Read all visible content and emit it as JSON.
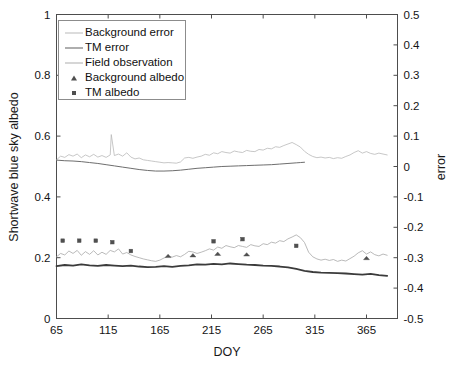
{
  "chart_data": {
    "type": "line",
    "title": "",
    "xlabel": "DOY",
    "ylabel": "Shortwave blue sky albedo",
    "ylabel_right": "error",
    "xlim": [
      65,
      395
    ],
    "ylim": [
      0,
      1
    ],
    "ylim_right": [
      -0.5,
      0.5
    ],
    "xticks": [
      65,
      115,
      165,
      215,
      265,
      315,
      365
    ],
    "xticklabels": [
      "65",
      "115",
      "165",
      "215",
      "265",
      "315",
      "365"
    ],
    "yticks": [
      0,
      0.2,
      0.4,
      0.6,
      0.8,
      1
    ],
    "yticklabels": [
      "0",
      "0.2",
      "0.4",
      "0.6",
      "0.8",
      "1"
    ],
    "yticks_right": [
      -0.5,
      -0.4,
      -0.3,
      -0.2,
      -0.1,
      0,
      0.1,
      0.2,
      0.3,
      0.4,
      0.5
    ],
    "yticklabels_right": [
      "-0.5",
      "-0.4",
      "-0.3",
      "-0.2",
      "-0.1",
      "0",
      "0.1",
      "0.2",
      "0.3",
      "0.4",
      "0.5"
    ],
    "grid": false,
    "legend_position": "upper-left",
    "series": [
      {
        "name": "Background error",
        "axis": "right",
        "color": "#b9b9b9",
        "width": 0.8,
        "style": "line",
        "x": [
          65,
          69,
          73,
          77,
          81,
          85,
          89,
          93,
          97,
          101,
          105,
          109,
          113,
          117,
          118,
          121,
          125,
          129,
          133,
          137,
          141,
          145,
          149,
          153,
          157,
          161,
          165,
          169,
          173,
          177,
          181,
          185,
          189,
          193,
          197,
          201,
          205,
          209,
          213,
          217,
          221,
          225,
          229,
          233,
          237,
          241,
          245,
          249,
          253,
          257,
          261,
          265,
          269,
          273,
          277,
          281,
          285,
          289,
          293,
          297,
          301,
          305,
          309,
          313,
          317,
          321,
          325,
          329,
          333,
          337,
          341,
          345,
          349,
          353,
          357,
          361,
          365,
          369,
          373,
          377,
          381,
          385
        ],
        "y": [
          0.022,
          0.034,
          0.03,
          0.039,
          0.034,
          0.041,
          0.029,
          0.038,
          0.032,
          0.04,
          0.031,
          0.036,
          0.03,
          0.038,
          0.105,
          0.036,
          0.041,
          0.034,
          0.045,
          0.031,
          0.025,
          0.028,
          0.022,
          0.02,
          0.018,
          0.016,
          0.014,
          0.012,
          0.013,
          0.012,
          0.011,
          0.015,
          0.028,
          0.03,
          0.027,
          0.031,
          0.034,
          0.04,
          0.037,
          0.045,
          0.042,
          0.049,
          0.046,
          0.044,
          0.051,
          0.048,
          0.046,
          0.053,
          0.05,
          0.049,
          0.056,
          0.054,
          0.06,
          0.058,
          0.065,
          0.063,
          0.069,
          0.074,
          0.079,
          0.072,
          0.064,
          0.05,
          0.04,
          0.033,
          0.029,
          0.031,
          0.028,
          0.03,
          0.026,
          0.029,
          0.027,
          0.033,
          0.038,
          0.046,
          0.052,
          0.044,
          0.049,
          0.043,
          0.04,
          0.044,
          0.041,
          0.038
        ]
      },
      {
        "name": "TM error",
        "axis": "right",
        "color": "#6e6e6e",
        "width": 1.0,
        "style": "line",
        "x": [
          65,
          73,
          81,
          89,
          97,
          105,
          113,
          121,
          129,
          137,
          145,
          153,
          161,
          169,
          177,
          185,
          193,
          201,
          209,
          217,
          225,
          233,
          241,
          249,
          257,
          265,
          273,
          281,
          289,
          297,
          301,
          305
        ],
        "y": [
          0.021,
          0.019,
          0.018,
          0.016,
          0.013,
          0.01,
          0.006,
          0.002,
          -0.002,
          -0.006,
          -0.01,
          -0.013,
          -0.015,
          -0.015,
          -0.014,
          -0.012,
          -0.009,
          -0.006,
          -0.004,
          -0.002,
          0.0,
          0.001,
          0.002,
          0.003,
          0.004,
          0.005,
          0.006,
          0.008,
          0.01,
          0.012,
          0.013,
          0.014
        ]
      },
      {
        "name": "Field observation",
        "axis": "left",
        "color": "#a8a8a8",
        "width": 0.8,
        "style": "line",
        "x": [
          65,
          69,
          73,
          77,
          81,
          85,
          89,
          93,
          97,
          101,
          105,
          109,
          113,
          117,
          121,
          125,
          129,
          133,
          137,
          141,
          145,
          149,
          153,
          157,
          161,
          165,
          169,
          173,
          177,
          181,
          185,
          189,
          193,
          197,
          201,
          205,
          209,
          213,
          217,
          221,
          225,
          229,
          233,
          237,
          241,
          245,
          249,
          253,
          257,
          261,
          265,
          269,
          273,
          277,
          281,
          285,
          289,
          293,
          297,
          301,
          305,
          309,
          313,
          317,
          321,
          325,
          329,
          333,
          337,
          341,
          345,
          349,
          353,
          357,
          361,
          365,
          369,
          373,
          377,
          381,
          385
        ],
        "y": [
          0.203,
          0.214,
          0.209,
          0.222,
          0.214,
          0.224,
          0.208,
          0.22,
          0.211,
          0.223,
          0.209,
          0.218,
          0.211,
          0.224,
          0.219,
          0.229,
          0.212,
          0.217,
          0.209,
          0.204,
          0.2,
          0.196,
          0.193,
          0.19,
          0.188,
          0.192,
          0.199,
          0.205,
          0.202,
          0.207,
          0.203,
          0.211,
          0.221,
          0.219,
          0.214,
          0.218,
          0.223,
          0.229,
          0.225,
          0.235,
          0.231,
          0.24,
          0.236,
          0.233,
          0.24,
          0.237,
          0.234,
          0.243,
          0.239,
          0.237,
          0.246,
          0.243,
          0.251,
          0.248,
          0.256,
          0.253,
          0.262,
          0.268,
          0.275,
          0.266,
          0.25,
          0.218,
          0.203,
          0.196,
          0.192,
          0.195,
          0.191,
          0.194,
          0.188,
          0.192,
          0.189,
          0.197,
          0.205,
          0.216,
          0.223,
          0.212,
          0.219,
          0.21,
          0.206,
          0.212,
          0.208
        ]
      },
      {
        "name": "TM albedo",
        "axis": "left",
        "color": "#3b3b3b",
        "width": 1.8,
        "style": "thick-line",
        "x": [
          65,
          73,
          81,
          89,
          97,
          105,
          113,
          121,
          129,
          137,
          145,
          153,
          161,
          169,
          177,
          185,
          193,
          201,
          209,
          217,
          225,
          233,
          241,
          249,
          257,
          265,
          273,
          281,
          289,
          297,
          305,
          313,
          321,
          329,
          337,
          345,
          353,
          361,
          369,
          377,
          385
        ],
        "y": [
          0.172,
          0.176,
          0.174,
          0.178,
          0.175,
          0.173,
          0.176,
          0.174,
          0.172,
          0.174,
          0.171,
          0.169,
          0.17,
          0.172,
          0.17,
          0.173,
          0.175,
          0.178,
          0.177,
          0.18,
          0.178,
          0.181,
          0.179,
          0.177,
          0.176,
          0.174,
          0.173,
          0.171,
          0.168,
          0.163,
          0.157,
          0.153,
          0.151,
          0.15,
          0.149,
          0.148,
          0.146,
          0.144,
          0.147,
          0.143,
          0.14
        ]
      }
    ],
    "markers": [
      {
        "name": "Background albedo",
        "axis": "left",
        "marker": "triangle",
        "color": "#4f4f4f",
        "x": [
          173,
          197,
          221,
          249,
          365
        ],
        "y": [
          0.206,
          0.208,
          0.213,
          0.211,
          0.199
        ]
      },
      {
        "name": "TM albedo",
        "axis": "left",
        "marker": "square",
        "color": "#4f4f4f",
        "x": [
          71,
          87,
          103,
          119,
          137,
          217,
          245,
          297
        ],
        "y": [
          0.256,
          0.256,
          0.256,
          0.251,
          0.222,
          0.254,
          0.261,
          0.239
        ]
      }
    ],
    "legend": [
      {
        "label": "Background error",
        "key": "line",
        "color": "#b9b9b9",
        "width": 1.0
      },
      {
        "label": "TM error",
        "key": "line",
        "color": "#5e5e5e",
        "width": 1.6
      },
      {
        "label": "Field observation",
        "key": "line",
        "color": "#aeaeae",
        "width": 1.0
      },
      {
        "label": "Background albedo",
        "key": "triangle",
        "color": "#4f4f4f",
        "width": 0
      },
      {
        "label": "TM albedo",
        "key": "square",
        "color": "#4f4f4f",
        "width": 0
      }
    ]
  },
  "colors": {
    "axis": "#4d4d4d",
    "text": "#131313",
    "background": "#ffffff",
    "legend_border": "#8c8c8c"
  }
}
